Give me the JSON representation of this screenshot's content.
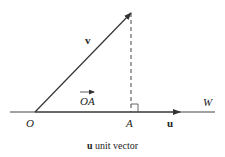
{
  "diagram": {
    "type": "vector projection",
    "labels": {
      "v": "v",
      "oa": "OA",
      "o": "O",
      "a": "A",
      "u": "u",
      "w": "W"
    },
    "caption": {
      "bold_part": "u",
      "rest": " unit vector"
    },
    "colors": {
      "line": "#333333",
      "text": "#222222"
    }
  }
}
